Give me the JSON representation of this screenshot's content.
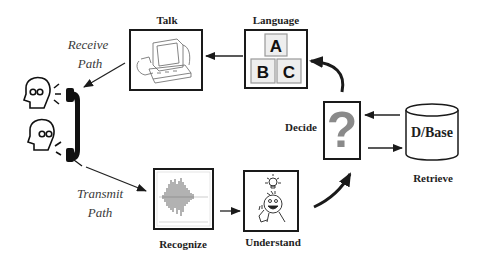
{
  "diagram": {
    "nodes": {
      "talk": {
        "label": "Talk",
        "icon": "computer-icon"
      },
      "language": {
        "label": "Language",
        "icon": "abc-blocks-icon",
        "blocks": [
          "A",
          "B",
          "C"
        ]
      },
      "decide": {
        "label": "Decide",
        "icon": "question-mark-icon",
        "glyph": "?"
      },
      "database": {
        "label": "D/Base",
        "caption": "Retrieve"
      },
      "recognize": {
        "label": "Recognize",
        "icon": "waveform-icon"
      },
      "understand": {
        "label": "Understand",
        "icon": "lightbulb-person-icon"
      },
      "phone": {
        "icon": "telephone-handset-icon"
      }
    },
    "paths": {
      "receive": [
        "Receive",
        "Path"
      ],
      "transmit": [
        "Transmit",
        "Path"
      ]
    },
    "edges": [
      {
        "from": "Language",
        "to": "Talk"
      },
      {
        "from": "Talk",
        "to": "Phone",
        "label": "Receive Path"
      },
      {
        "from": "Phone",
        "to": "Recognize",
        "label": "Transmit Path"
      },
      {
        "from": "Recognize",
        "to": "Understand"
      },
      {
        "from": "Understand",
        "to": "Decide"
      },
      {
        "from": "Decide",
        "to": "Language"
      },
      {
        "from": "D/Base",
        "to": "Decide"
      },
      {
        "from": "Decide",
        "to": "D/Base"
      }
    ]
  }
}
